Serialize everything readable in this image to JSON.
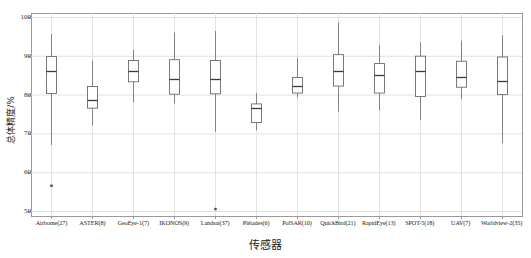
{
  "chart_data": {
    "type": "box",
    "title": "",
    "xlabel": "传感器",
    "ylabel": "总体精度/%",
    "ylim": [
      47,
      101
    ],
    "yticks": [
      50,
      60,
      70,
      80,
      90,
      100
    ],
    "ytick_labels": [
      "50",
      "60",
      "70",
      "80",
      "90",
      "100"
    ],
    "grid": true,
    "legend": "none",
    "categories": [
      "Airborne(27)",
      "ASTER(8)",
      "GeoEye-1(7)",
      "IKONOS(9)",
      "Landsat(37)",
      "Pléiades(6)",
      "PolSAR(10)",
      "QuickBird(21)",
      "RapidEye(13)",
      "SPOT-5(18)",
      "UAV(7)",
      "Worldview-2(35)"
    ],
    "boxes": [
      {
        "category": "Airborne(27)",
        "whisker_low": 67.0,
        "q1": 80.3,
        "median": 86.0,
        "q3": 89.8,
        "whisker_high": 95.6,
        "outliers": [
          56.5
        ]
      },
      {
        "category": "ASTER(8)",
        "whisker_low": 72.0,
        "q1": 76.5,
        "median": 78.7,
        "q3": 82.1,
        "whisker_high": 88.8,
        "outliers": []
      },
      {
        "category": "GeoEye-1(7)",
        "whisker_low": 78.0,
        "q1": 83.3,
        "median": 86.2,
        "q3": 88.8,
        "whisker_high": 91.6,
        "outliers": []
      },
      {
        "category": "IKONOS(9)",
        "whisker_low": 77.7,
        "q1": 80.1,
        "median": 84.0,
        "q3": 89.0,
        "whisker_high": 96.0,
        "outliers": []
      },
      {
        "category": "Landsat(37)",
        "whisker_low": 70.4,
        "q1": 80.2,
        "median": 84.0,
        "q3": 88.8,
        "whisker_high": 96.4,
        "outliers": [
          50.5
        ]
      },
      {
        "category": "Pléiades(6)",
        "whisker_low": 70.8,
        "q1": 72.8,
        "median": 76.6,
        "q3": 77.6,
        "whisker_high": 80.4,
        "outliers": []
      },
      {
        "category": "PolSAR(10)",
        "whisker_low": 79.3,
        "q1": 80.4,
        "median": 82.1,
        "q3": 84.4,
        "whisker_high": 89.5,
        "outliers": []
      },
      {
        "category": "QuickBird(21)",
        "whisker_low": 75.6,
        "q1": 82.2,
        "median": 86.1,
        "q3": 90.3,
        "whisker_high": 98.6,
        "outliers": []
      },
      {
        "category": "RapidEye(13)",
        "whisker_low": 75.9,
        "q1": 80.4,
        "median": 85.0,
        "q3": 88.0,
        "whisker_high": 92.7,
        "outliers": []
      },
      {
        "category": "SPOT-5(18)",
        "whisker_low": 73.5,
        "q1": 79.5,
        "median": 86.2,
        "q3": 89.9,
        "whisker_high": 93.5,
        "outliers": []
      },
      {
        "category": "UAV(7)",
        "whisker_low": 78.8,
        "q1": 81.9,
        "median": 84.6,
        "q3": 88.6,
        "whisker_high": 93.9,
        "outliers": []
      },
      {
        "category": "Worldview-2(35)",
        "whisker_low": 67.5,
        "q1": 80.0,
        "median": 83.5,
        "q3": 89.7,
        "whisker_high": 95.3,
        "outliers": []
      }
    ]
  },
  "style": {
    "line_color": "#6b6b6b",
    "median_color": "#3a3a3a",
    "grid_color": "#e2e2e2",
    "frame_color": "#9a9a9a",
    "outlier_color": "#4a4a4a",
    "background": "#ffffff"
  }
}
